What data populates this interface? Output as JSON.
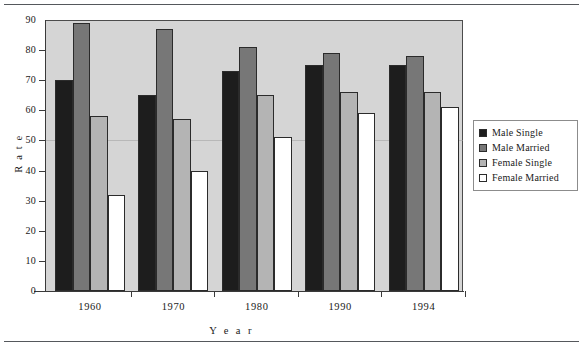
{
  "figure": {
    "has_top_rule": true,
    "has_bottom_rule": true,
    "plot_background": "#d5d5d5",
    "page_background": "#ffffff"
  },
  "legend": {
    "position": "right",
    "entries": [
      {
        "label": "Male  Single",
        "color": "#1d1d1d"
      },
      {
        "label": "Male  Married",
        "color": "#777777"
      },
      {
        "label": "Female  Single",
        "color": "#b4b4b4"
      },
      {
        "label": "Female  Married",
        "color": "#ffffff"
      }
    ]
  },
  "chart_data": {
    "type": "bar",
    "title": "",
    "xlabel": "Y e a r",
    "ylabel": "R a t e",
    "categories": [
      "1960",
      "1970",
      "1980",
      "1990",
      "1994"
    ],
    "series": [
      {
        "name": "Male  Single",
        "color": "#1d1d1d",
        "values": [
          70,
          65,
          73,
          75,
          75
        ]
      },
      {
        "name": "Male  Married",
        "color": "#777777",
        "values": [
          89,
          87,
          81,
          79,
          78
        ]
      },
      {
        "name": "Female  Single",
        "color": "#b4b4b4",
        "values": [
          58,
          57,
          65,
          66,
          66
        ]
      },
      {
        "name": "Female  Married",
        "color": "#ffffff",
        "values": [
          32,
          40,
          51,
          59,
          61
        ]
      }
    ],
    "ylim": [
      0,
      90
    ],
    "yticks": [
      0,
      10,
      20,
      30,
      40,
      50,
      60,
      70,
      80,
      90
    ],
    "ytick_labels": [
      "0",
      "10",
      "20",
      "30",
      "40",
      "50",
      "60",
      "70",
      "80",
      "90"
    ],
    "grid": false,
    "legend_position": "right"
  }
}
